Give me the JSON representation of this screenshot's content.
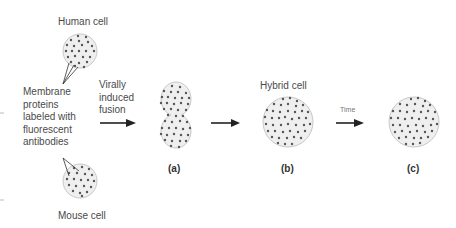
{
  "labels": {
    "human_cell": "Human cell",
    "mouse_cell": "Mouse cell",
    "membrane_proteins": [
      "Membrane",
      "proteins",
      "labeled with",
      "fluorescent",
      "antibodies"
    ],
    "fusion": [
      "Virally",
      "induced",
      "fusion"
    ],
    "hybrid_cell": "Hybrid cell",
    "time": "Time",
    "step_a": "(a)",
    "step_b": "(b)",
    "step_c": "(c)"
  },
  "colors": {
    "cell_fill": "#efefef",
    "cell_stroke": "#c8c8c8",
    "protein_dot": "#555555",
    "arrow": "#222222"
  }
}
